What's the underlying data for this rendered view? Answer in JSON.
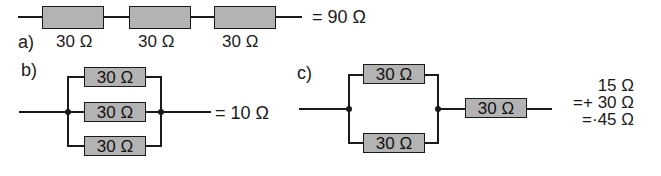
{
  "figure": {
    "panels": [
      {
        "id": "a",
        "label": "a)",
        "type": "series",
        "resistors": [
          {
            "value": "30 Ω"
          },
          {
            "value": "30 Ω"
          },
          {
            "value": "30 Ω"
          }
        ],
        "result": "= 90 Ω"
      },
      {
        "id": "b",
        "label": "b)",
        "type": "parallel",
        "resistors": [
          {
            "value": "30 Ω"
          },
          {
            "value": "30 Ω"
          },
          {
            "value": "30 Ω"
          }
        ],
        "result": "= 10 Ω"
      },
      {
        "id": "c",
        "label": "c)",
        "type": "parallel-then-series",
        "parallel_resistors": [
          {
            "value": "30 Ω"
          },
          {
            "value": "30 Ω"
          }
        ],
        "series_resistor": {
          "value": "30 Ω"
        },
        "result_lines": [
          "15 Ω",
          "=+ 30 Ω",
          "=·45 Ω"
        ]
      }
    ],
    "colors": {
      "resistor_fill": "#b3b3b3",
      "wire": "#1a1a1a",
      "background": "#ffffff"
    }
  }
}
